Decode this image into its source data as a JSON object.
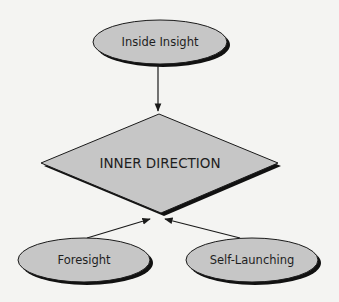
{
  "colors": {
    "background": "#f4f4f2",
    "node_fill": "#c6c6c6",
    "stroke": "#1a1a1a",
    "shadow": "#111111",
    "text": "#1e1e1e"
  },
  "diagram": {
    "top_node": {
      "label": "Inside Insight",
      "shape": "ellipse"
    },
    "center_node": {
      "label": "INNER DIRECTION",
      "shape": "diamond"
    },
    "bottom_left_node": {
      "label": "Foresight",
      "shape": "ellipse"
    },
    "bottom_right_node": {
      "label": "Self-Launching",
      "shape": "ellipse"
    },
    "edges": [
      {
        "from": "Inside Insight",
        "to": "INNER DIRECTION"
      },
      {
        "from": "Foresight",
        "to": "INNER DIRECTION"
      },
      {
        "from": "Self-Launching",
        "to": "INNER DIRECTION"
      }
    ]
  }
}
